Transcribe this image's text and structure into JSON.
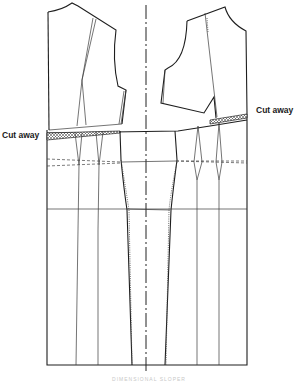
{
  "figure": {
    "labels": {
      "cut_away_left": "Cut away",
      "cut_away_right": "Cut away"
    },
    "caption": "DIMENSIONAL SLOPER"
  },
  "pieces": [
    {
      "name": "back-bodice",
      "side": "left"
    },
    {
      "name": "front-bodice",
      "side": "right"
    },
    {
      "name": "waist-cut-away-strip-left",
      "fill": "crosshatch"
    },
    {
      "name": "waist-cut-away-strip-right",
      "fill": "crosshatch"
    },
    {
      "name": "skirt-panel-grid",
      "lines": [
        "hip-line-dashed",
        "hip-line",
        "waist-line"
      ]
    }
  ],
  "colors": {
    "line": "#2a2a2a",
    "background": "#ffffff",
    "caption": "#c8c8c8"
  }
}
